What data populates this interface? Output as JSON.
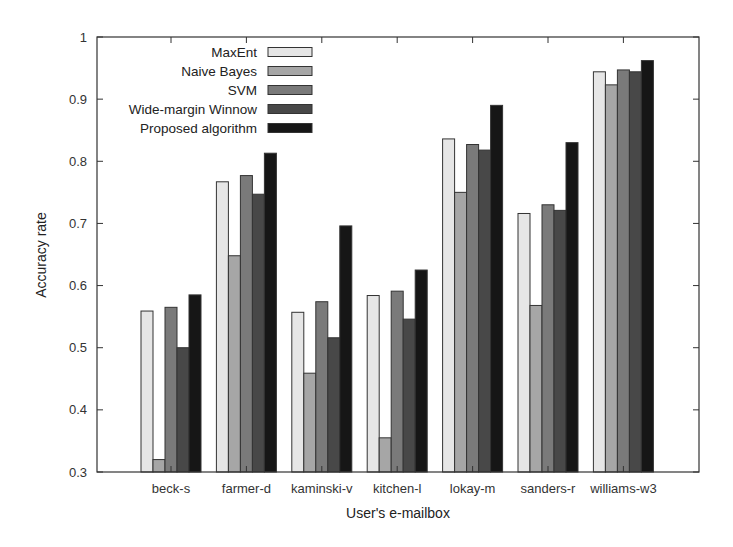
{
  "chart_data": {
    "type": "bar",
    "title": "",
    "xlabel": "User's e-mailbox",
    "ylabel": "Accuracy rate",
    "ylim": [
      0.3,
      1.0
    ],
    "yticks": [
      "0.3",
      "0.4",
      "0.5",
      "0.6",
      "0.7",
      "0.8",
      "0.9",
      "1"
    ],
    "grid": false,
    "legend_position": "top-left (inside)",
    "categories": [
      "beck-s",
      "farmer-d",
      "kaminski-v",
      "kitchen-l",
      "lokay-m",
      "sanders-r",
      "williams-w3"
    ],
    "series": [
      {
        "name": "MaxEnt",
        "color": "#e6e6e6",
        "values": [
          0.559,
          0.767,
          0.557,
          0.584,
          0.836,
          0.716,
          0.944
        ]
      },
      {
        "name": "Naive Bayes",
        "color": "#a6a6a6",
        "values": [
          0.32,
          0.648,
          0.459,
          0.355,
          0.75,
          0.568,
          0.923
        ]
      },
      {
        "name": "SVM",
        "color": "#7a7a7a",
        "values": [
          0.565,
          0.777,
          0.574,
          0.591,
          0.827,
          0.73,
          0.947
        ]
      },
      {
        "name": "Wide-margin Winnow",
        "color": "#484848",
        "values": [
          0.5,
          0.747,
          0.516,
          0.546,
          0.818,
          0.721,
          0.944
        ]
      },
      {
        "name": "Proposed algorithm",
        "color": "#161616",
        "values": [
          0.585,
          0.813,
          0.696,
          0.625,
          0.89,
          0.83,
          0.962
        ]
      }
    ]
  }
}
